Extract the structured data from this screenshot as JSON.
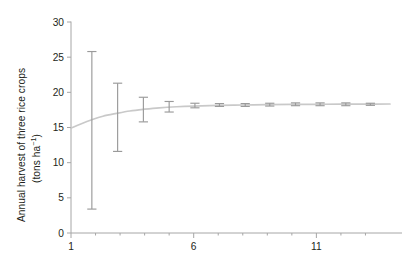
{
  "chart_data": {
    "type": "line",
    "title": "",
    "xlabel": "",
    "ylabel": "Annual harvest of three rice crops (tons ha⁻¹)",
    "ylabel_line1": "Annual harvest of three rice crops",
    "ylabel_line2_prefix": "(tons ha",
    "ylabel_line2_sup": "−1",
    "ylabel_line2_suffix": ")",
    "xlim": [
      1,
      14
    ],
    "ylim": [
      0,
      30
    ],
    "grid": false,
    "legend": null,
    "y_ticks": [
      0,
      5,
      10,
      15,
      20,
      25,
      30
    ],
    "y_tick_labels": [
      "0",
      "5",
      "10",
      "15",
      "20",
      "25",
      "30"
    ],
    "x_ticks": [
      1,
      2,
      3,
      4,
      5,
      6,
      7,
      8,
      9,
      10,
      11,
      12,
      13
    ],
    "x_tick_labels_major": [
      "1",
      "6",
      "11"
    ],
    "x_major_ticks": [
      1,
      6,
      11
    ],
    "series": [
      {
        "name": "fitted-curve",
        "type": "line",
        "color": "#c9c9c9",
        "x": [
          1.0,
          1.4,
          1.85,
          2.3,
          2.85,
          3.4,
          4.0,
          4.6,
          5.3,
          6.0,
          7.0,
          8.0,
          9.0,
          10.0,
          11.0,
          12.0,
          13.0,
          14.0
        ],
        "y": [
          14.9,
          15.5,
          16.1,
          16.6,
          17.0,
          17.35,
          17.6,
          17.8,
          17.95,
          18.05,
          18.15,
          18.2,
          18.25,
          18.28,
          18.3,
          18.32,
          18.33,
          18.34
        ]
      },
      {
        "name": "mean-with-error-bars",
        "type": "errorbar",
        "color": "#9a9a9a",
        "x": [
          1.85,
          2.9,
          3.95,
          5.0,
          6.05,
          7.05,
          8.1,
          9.1,
          10.15,
          11.15,
          12.2,
          13.2
        ],
        "y": [
          14.9,
          16.4,
          17.5,
          17.9,
          18.1,
          18.2,
          18.2,
          18.25,
          18.3,
          18.3,
          18.3,
          18.3
        ],
        "y_lower": [
          3.4,
          11.6,
          15.8,
          17.2,
          17.8,
          18.0,
          18.0,
          18.05,
          18.1,
          18.1,
          18.1,
          18.15
        ],
        "y_upper": [
          25.8,
          21.3,
          19.3,
          18.7,
          18.45,
          18.4,
          18.4,
          18.45,
          18.5,
          18.5,
          18.5,
          18.45
        ]
      }
    ]
  },
  "axis_style": {
    "axis_color": "#a6a6a6",
    "tick_label_color": "#231f20",
    "curve_color": "#c9c9c9",
    "errorbar_color": "#9a9a9a",
    "background": "#ffffff"
  }
}
